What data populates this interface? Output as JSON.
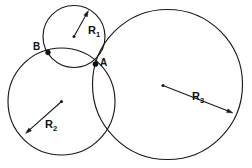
{
  "diagram": {
    "background_color": "#ffffff",
    "stroke_color": "#1a1a1a",
    "width": 252,
    "height": 168,
    "circles": [
      {
        "id": "circle-1",
        "radius_label": "R",
        "radius_subscript": "1",
        "center_x": 74,
        "center_y": 36.5,
        "radius": 31,
        "label_x": 88,
        "label_y": 34,
        "arrow_from_x": 74,
        "arrow_from_y": 36.5,
        "arrow_to_x": 88.5,
        "arrow_to_y": 10.5
      },
      {
        "id": "circle-2",
        "radius_label": "R",
        "radius_subscript": "2",
        "center_x": 61.5,
        "center_y": 101.5,
        "radius": 53.5,
        "label_x": 45,
        "label_y": 128,
        "arrow_from_x": 61.5,
        "arrow_from_y": 101.5,
        "arrow_to_x": 25.5,
        "arrow_to_y": 133.5
      },
      {
        "id": "circle-3",
        "radius_label": "R",
        "radius_subscript": "3",
        "center_x": 167.5,
        "center_y": 84.5,
        "radius": 75,
        "label_x": 192,
        "label_y": 100,
        "arrow_from_x": 163,
        "arrow_from_y": 85.5,
        "arrow_to_x": 233,
        "arrow_to_y": 113
      }
    ],
    "points": [
      {
        "id": "point-a",
        "label": "A",
        "x": 95.5,
        "y": 64,
        "label_x": 100,
        "label_y": 66
      },
      {
        "id": "point-b",
        "label": "B",
        "x": 48,
        "y": 52.5,
        "label_x": 33,
        "label_y": 50
      }
    ]
  }
}
